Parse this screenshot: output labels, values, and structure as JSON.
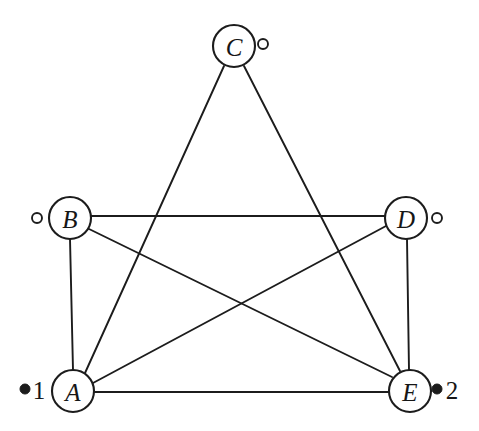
{
  "figure": {
    "background_color": "#ffffff",
    "line_color": "#1c1c1c",
    "width": 479,
    "height": 431
  },
  "nodes": [
    {
      "id": "A",
      "label": "A",
      "cx": 73,
      "cy": 391,
      "r": 21
    },
    {
      "id": "B",
      "label": "B",
      "cx": 70,
      "cy": 218,
      "r": 21
    },
    {
      "id": "C",
      "label": "C",
      "cx": 234,
      "cy": 46,
      "r": 21
    },
    {
      "id": "D",
      "label": "D",
      "cx": 406,
      "cy": 218,
      "r": 21
    },
    {
      "id": "E",
      "label": "E",
      "cx": 410,
      "cy": 391,
      "r": 21
    }
  ],
  "edges": [
    {
      "from": "A",
      "to": "B",
      "x1": 73,
      "y1": 370,
      "x2": 70,
      "y2": 239
    },
    {
      "from": "A",
      "to": "C",
      "x1": 85,
      "y1": 373,
      "x2": 224,
      "y2": 66
    },
    {
      "from": "A",
      "to": "D",
      "x1": 93,
      "y1": 383,
      "x2": 386,
      "y2": 226
    },
    {
      "from": "A",
      "to": "E",
      "x1": 94,
      "y1": 392,
      "x2": 389,
      "y2": 392
    },
    {
      "from": "B",
      "to": "D",
      "x1": 91,
      "y1": 216,
      "x2": 385,
      "y2": 216
    },
    {
      "from": "B",
      "to": "E",
      "x1": 87,
      "y1": 228,
      "x2": 392,
      "y2": 377
    },
    {
      "from": "C",
      "to": "E",
      "x1": 244,
      "y1": 66,
      "x2": 400,
      "y2": 371
    },
    {
      "from": "D",
      "to": "E",
      "x1": 407,
      "y1": 239,
      "x2": 409,
      "y2": 370
    }
  ],
  "ports": [
    {
      "id": "port-b",
      "kind": "open",
      "cx": 37,
      "cy": 218,
      "r": 5,
      "label": ""
    },
    {
      "id": "port-c",
      "kind": "open",
      "cx": 263,
      "cy": 44,
      "r": 5,
      "label": ""
    },
    {
      "id": "port-d",
      "kind": "open",
      "cx": 437,
      "cy": 218,
      "r": 5,
      "label": ""
    },
    {
      "id": "port-a",
      "kind": "filled",
      "cx": 25,
      "cy": 389,
      "r": 5,
      "label": "1",
      "label_x": 39,
      "label_y": 389
    },
    {
      "id": "port-e",
      "kind": "filled",
      "cx": 437,
      "cy": 389,
      "r": 5,
      "label": "2",
      "label_x": 452,
      "label_y": 389
    }
  ]
}
